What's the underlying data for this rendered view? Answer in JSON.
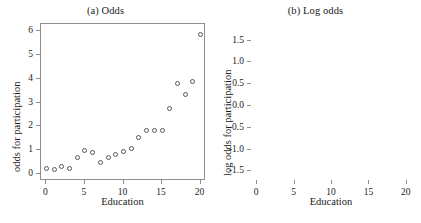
{
  "figure": {
    "background_color": "#ffffff",
    "frame_color": "#8e8e8e",
    "marker_color": "#555555",
    "text_color": "#1a1a1a"
  },
  "panels": {
    "a": {
      "title": "(a) Odds",
      "xlabel": "Education",
      "ylabel": "odds for participation",
      "xticks": [
        "0",
        "5",
        "10",
        "15",
        "20"
      ],
      "yticks": [
        "0",
        "1",
        "2",
        "3",
        "4",
        "5",
        "6"
      ]
    },
    "b": {
      "title": "(b) Log odds",
      "xlabel": "Education",
      "ylabel": "log odds for participation",
      "xticks": [
        "0",
        "5",
        "10",
        "15",
        "20"
      ],
      "yticks": [
        "-1.5",
        "-1.0",
        "-0.5",
        "0.0",
        "0.5",
        "1.0",
        "1.5"
      ]
    }
  },
  "chart_data": [
    {
      "type": "scatter",
      "panel": "a",
      "title": "(a) Odds",
      "xlabel": "Education",
      "ylabel": "odds for participation",
      "xlim": [
        -0.7,
        20.7
      ],
      "ylim": [
        -0.28,
        6.28
      ],
      "xticks": [
        0,
        5,
        10,
        15,
        20
      ],
      "yticks": [
        0,
        1,
        2,
        3,
        4,
        5,
        6
      ],
      "grid": false,
      "legend": null,
      "marker": "open-circle",
      "x": [
        0,
        1,
        2,
        3,
        4,
        5,
        6,
        7,
        8,
        9,
        10,
        11,
        12,
        13,
        14,
        15,
        16,
        17,
        18,
        19,
        20
      ],
      "y": [
        0.26,
        0.22,
        0.32,
        0.23,
        0.7,
        1.0,
        0.91,
        0.51,
        0.7,
        0.84,
        0.94,
        1.08,
        1.52,
        1.84,
        1.85,
        1.83,
        2.75,
        3.78,
        3.35,
        3.87,
        5.85
      ]
    },
    {
      "type": "scatter",
      "panel": "b",
      "title": "(b) Log odds",
      "xlabel": "Education",
      "ylabel": "log odds for participation",
      "xlim": [
        -0.7,
        20.7
      ],
      "ylim": [
        -1.72,
        1.88
      ],
      "xticks": [
        0,
        5,
        10,
        15,
        20
      ],
      "yticks": [
        -1.5,
        -1.0,
        -0.5,
        0.0,
        0.5,
        1.0,
        1.5
      ],
      "grid": false,
      "legend": null,
      "marker": "open-circle",
      "x": [
        0,
        1,
        2,
        3,
        4,
        5,
        6,
        7,
        8,
        9,
        10,
        11,
        12,
        13,
        14,
        15,
        16,
        17,
        18,
        19,
        20
      ],
      "y": [
        -1.35,
        -1.51,
        -1.15,
        -1.47,
        -0.36,
        0.0,
        -0.09,
        -0.67,
        -0.35,
        -0.17,
        -0.06,
        0.08,
        0.42,
        0.61,
        0.62,
        0.6,
        1.01,
        1.33,
        1.21,
        1.35,
        1.77
      ]
    }
  ]
}
